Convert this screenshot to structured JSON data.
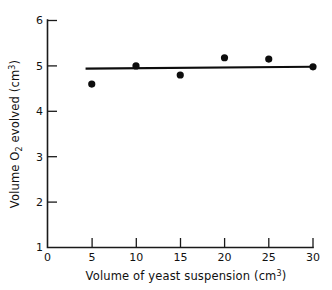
{
  "chart_data": {
    "type": "scatter",
    "title": "",
    "xlabel": "Volume of yeast suspension (cm3)",
    "xlabel_parts": {
      "main": "Volume of yeast suspension (cm",
      "exponent": "3",
      "tail": ")"
    },
    "ylabel": "Volume O2 evolved (cm3)",
    "ylabel_parts": {
      "lead": "Volume O",
      "subscript": "2",
      "middle": " evolved (cm",
      "exponent": "3",
      "tail": ")"
    },
    "x": [
      5,
      10,
      15,
      20,
      25,
      30
    ],
    "values": [
      4.6,
      5.0,
      4.8,
      5.18,
      5.15,
      4.98
    ],
    "series": [
      {
        "name": "Volume O2 evolved",
        "x": [
          5,
          10,
          15,
          20,
          25,
          30
        ],
        "values": [
          4.6,
          5.0,
          4.8,
          5.18,
          5.15,
          4.98
        ]
      }
    ],
    "trend_line": {
      "x": [
        4.3,
        30.0
      ],
      "y": [
        4.94,
        4.98
      ]
    },
    "xlim": [
      0,
      30
    ],
    "ylim": [
      1,
      6
    ],
    "xticks": [
      0,
      5,
      10,
      15,
      20,
      25,
      30
    ],
    "yticks": [
      1,
      2,
      3,
      4,
      5,
      6
    ],
    "xtick_labels": [
      "0",
      "5",
      "10",
      "15",
      "20",
      "25",
      "30"
    ],
    "ytick_labels": [
      "1",
      "2",
      "3",
      "4",
      "5",
      "6"
    ],
    "grid": false,
    "legend": null,
    "marker": "filled-circle",
    "marker_color": "#0d0d0d",
    "line_color": "#0d0d0d",
    "axis_color": "#1a1a1a",
    "background_color": "#ffffff",
    "tick_direction": "inward"
  }
}
